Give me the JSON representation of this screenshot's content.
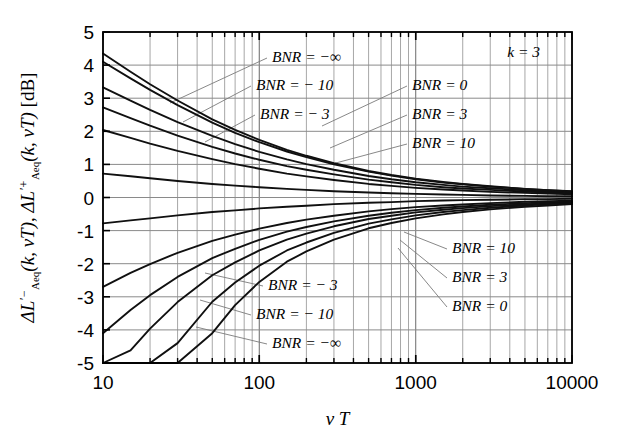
{
  "figure": {
    "background": "#ffffff",
    "plot_frame_color": "#000000",
    "grid_color": "#8a8a8a",
    "curve_color": "#101010",
    "leader_color": "#7a7a7a"
  },
  "axes": {
    "x": {
      "label": "ν T",
      "scale": "log",
      "min": 10,
      "max": 10000,
      "tick_labels": [
        "10",
        "100",
        "1000",
        "10000"
      ],
      "tick_values": [
        10,
        100,
        1000,
        10000
      ],
      "minor_ticks": true
    },
    "y": {
      "label_parts": {
        "delta1": "Δ",
        "L1": "L",
        "prime1": "′",
        "sup1": "−",
        "sub1": "Aeq",
        "arg1": "(k, νT)",
        "comma": ", ",
        "delta2": "Δ",
        "L2": "L",
        "prime2": "′",
        "sup2": "+",
        "sub2": "Aeq",
        "arg2": "(k, νT)",
        "unit": "[dB]"
      },
      "label_plain": "ΔL′⁻_Aeq(k,νT), ΔL′⁺_Aeq(k,νT) [dB]",
      "scale": "linear",
      "min": -5,
      "max": 5,
      "tick_labels": [
        "5",
        "4",
        "3",
        "2",
        "1",
        "0",
        "-1",
        "-2",
        "-3",
        "-4",
        "-5"
      ],
      "tick_values": [
        5,
        4,
        3,
        2,
        1,
        0,
        -1,
        -2,
        -3,
        -4,
        -5
      ]
    }
  },
  "annotations": {
    "k_label": "k = 3",
    "upper_left": [
      {
        "text": "BNR = −∞",
        "x": 272,
        "y": 62,
        "leader_to_x": 170,
        "leader_to_y": 103
      },
      {
        "text": "BNR = − 10",
        "x": 256,
        "y": 90,
        "leader_to_x": 183,
        "leader_to_y": 122
      },
      {
        "text": "BNR = − 3",
        "x": 260,
        "y": 119,
        "leader_to_x": 205,
        "leader_to_y": 142
      }
    ],
    "upper_right": [
      {
        "text": "BNR = 0",
        "x": 412,
        "y": 90,
        "leader_to_x": 322,
        "leader_to_y": 126
      },
      {
        "text": "BNR = 3",
        "x": 412,
        "y": 119,
        "leader_to_x": 330,
        "leader_to_y": 148
      },
      {
        "text": "BNR = 10",
        "x": 412,
        "y": 148,
        "leader_to_x": 332,
        "leader_to_y": 164
      }
    ],
    "lower_right": [
      {
        "text": "BNR = 10",
        "x": 452,
        "y": 253,
        "leader_to_x": 404,
        "leader_to_y": 232
      },
      {
        "text": "BNR = 3",
        "x": 452,
        "y": 282,
        "leader_to_x": 400,
        "leader_to_y": 240
      },
      {
        "text": "BNR = 0",
        "x": 452,
        "y": 311,
        "leader_to_x": 398,
        "leader_to_y": 248
      }
    ],
    "lower_middle": [
      {
        "text": "BNR = − 3",
        "x": 268,
        "y": 290,
        "leader_to_x": 205,
        "leader_to_y": 273
      },
      {
        "text": "BNR = − 10",
        "x": 256,
        "y": 319,
        "leader_to_x": 200,
        "leader_to_y": 300
      },
      {
        "text": "BNR = −∞",
        "x": 272,
        "y": 348,
        "leader_to_x": 196,
        "leader_to_y": 327
      }
    ]
  },
  "chart_data": {
    "type": "line",
    "title": "",
    "subtitle": "",
    "xlabel": "ν T",
    "ylabel": "ΔL′⁻_Aeq(k,νT), ΔL′⁺_Aeq(k,νT) [dB]",
    "xscale": "log",
    "yscale": "linear",
    "xlim": [
      10,
      10000
    ],
    "ylim": [
      -5,
      5
    ],
    "xticks": [
      10,
      100,
      1000,
      10000
    ],
    "yticks": [
      -5,
      -4,
      -3,
      -2,
      -1,
      0,
      1,
      2,
      3,
      4,
      5
    ],
    "grid": true,
    "legend": "inline-annotations",
    "parameter": {
      "name": "k",
      "value": 3
    },
    "note": "Upper family = positive deviation branch; lower family = negative deviation branch. x values in nu*T, y values in dB.",
    "x": [
      10,
      15,
      20,
      30,
      50,
      70,
      100,
      150,
      200,
      300,
      500,
      700,
      1000,
      1500,
      2000,
      3000,
      5000,
      7000,
      10000
    ],
    "series": [
      {
        "name": "BNR = -inf (upper)",
        "branch": "upper",
        "bnr": "-inf",
        "values": [
          4.35,
          3.8,
          3.42,
          2.93,
          2.36,
          2.04,
          1.74,
          1.44,
          1.26,
          1.04,
          0.8,
          0.68,
          0.57,
          0.47,
          0.41,
          0.34,
          0.26,
          0.22,
          0.19
        ]
      },
      {
        "name": "BNR = -10 (upper)",
        "branch": "upper",
        "bnr": -10,
        "values": [
          4.1,
          3.6,
          3.25,
          2.79,
          2.26,
          1.95,
          1.67,
          1.39,
          1.22,
          1.0,
          0.78,
          0.66,
          0.55,
          0.45,
          0.4,
          0.33,
          0.26,
          0.22,
          0.18
        ]
      },
      {
        "name": "BNR = -3 (upper)",
        "branch": "upper",
        "bnr": -3,
        "values": [
          3.33,
          2.93,
          2.65,
          2.28,
          1.86,
          1.61,
          1.38,
          1.15,
          1.01,
          0.84,
          0.65,
          0.55,
          0.46,
          0.38,
          0.33,
          0.28,
          0.22,
          0.18,
          0.15
        ]
      },
      {
        "name": "BNR = 0 (upper)",
        "branch": "upper",
        "bnr": 0,
        "values": [
          2.72,
          2.4,
          2.17,
          1.87,
          1.53,
          1.33,
          1.14,
          0.95,
          0.84,
          0.7,
          0.54,
          0.46,
          0.38,
          0.31,
          0.27,
          0.23,
          0.18,
          0.15,
          0.13
        ]
      },
      {
        "name": "BNR = 3 (upper)",
        "branch": "upper",
        "bnr": 3,
        "values": [
          2.04,
          1.8,
          1.63,
          1.41,
          1.16,
          1.01,
          0.87,
          0.72,
          0.64,
          0.53,
          0.41,
          0.35,
          0.29,
          0.24,
          0.21,
          0.17,
          0.14,
          0.12,
          0.1
        ]
      },
      {
        "name": "BNR = 10 (upper)",
        "branch": "upper",
        "bnr": 10,
        "values": [
          0.72,
          0.64,
          0.58,
          0.5,
          0.41,
          0.36,
          0.31,
          0.26,
          0.23,
          0.19,
          0.15,
          0.13,
          0.11,
          0.09,
          0.08,
          0.06,
          0.05,
          0.04,
          0.04
        ]
      },
      {
        "name": "BNR = 10 (lower)",
        "branch": "lower",
        "bnr": 10,
        "values": [
          -0.78,
          -0.69,
          -0.63,
          -0.54,
          -0.44,
          -0.39,
          -0.33,
          -0.28,
          -0.25,
          -0.2,
          -0.16,
          -0.14,
          -0.11,
          -0.09,
          -0.08,
          -0.07,
          -0.05,
          -0.05,
          -0.04
        ]
      },
      {
        "name": "BNR = 3 (lower)",
        "branch": "lower",
        "bnr": 3,
        "values": [
          -2.7,
          -2.28,
          -2.01,
          -1.67,
          -1.31,
          -1.12,
          -0.94,
          -0.77,
          -0.67,
          -0.55,
          -0.42,
          -0.35,
          -0.29,
          -0.24,
          -0.21,
          -0.17,
          -0.13,
          -0.11,
          -0.1
        ]
      },
      {
        "name": "BNR = 0 (lower)",
        "branch": "lower",
        "bnr": 0,
        "values": [
          -4.1,
          -3.4,
          -2.95,
          -2.4,
          -1.83,
          -1.55,
          -1.28,
          -1.03,
          -0.89,
          -0.72,
          -0.55,
          -0.46,
          -0.38,
          -0.31,
          -0.27,
          -0.22,
          -0.17,
          -0.15,
          -0.13
        ]
      },
      {
        "name": "BNR = -3 (lower)",
        "branch": "lower",
        "bnr": -3,
        "values": [
          -5.0,
          -4.62,
          -3.96,
          -3.16,
          -2.35,
          -1.96,
          -1.6,
          -1.27,
          -1.09,
          -0.87,
          -0.65,
          -0.55,
          -0.45,
          -0.37,
          -0.32,
          -0.26,
          -0.21,
          -0.17,
          -0.15
        ]
      },
      {
        "name": "BNR = -10 (lower)",
        "branch": "lower",
        "bnr": -10,
        "values": [
          -5.0,
          -5.0,
          -5.0,
          -4.4,
          -3.15,
          -2.57,
          -2.06,
          -1.6,
          -1.36,
          -1.07,
          -0.79,
          -0.66,
          -0.54,
          -0.44,
          -0.38,
          -0.31,
          -0.24,
          -0.2,
          -0.18
        ]
      },
      {
        "name": "BNR = -inf (lower)",
        "branch": "lower",
        "bnr": "-inf",
        "values": [
          -5.0,
          -5.0,
          -5.0,
          -5.0,
          -4.1,
          -3.25,
          -2.55,
          -1.94,
          -1.63,
          -1.27,
          -0.93,
          -0.77,
          -0.63,
          -0.51,
          -0.44,
          -0.36,
          -0.28,
          -0.24,
          -0.2
        ]
      }
    ]
  }
}
